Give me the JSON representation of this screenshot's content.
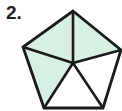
{
  "label": "2.",
  "figure": {
    "shape": "pentagon",
    "divisions": 5,
    "shaded_parts": 3,
    "fill_color": "#d8f0e2",
    "stroke_color": "#1a1a1a",
    "center": [
      73,
      63
    ],
    "vertices": [
      [
        73,
        11
      ],
      [
        121,
        50
      ],
      [
        103,
        108
      ],
      [
        44,
        108
      ],
      [
        23,
        47
      ]
    ],
    "triangles": [
      {
        "name": "top-right",
        "shaded": true
      },
      {
        "name": "right-bottom",
        "shaded": false
      },
      {
        "name": "bottom",
        "shaded": false
      },
      {
        "name": "left-bottom",
        "shaded": true
      },
      {
        "name": "top-left",
        "shaded": true
      }
    ]
  }
}
